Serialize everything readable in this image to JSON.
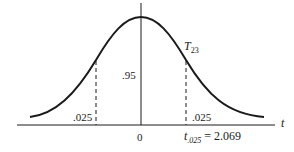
{
  "diagram": {
    "distribution_label": "T",
    "distribution_subscript": "23",
    "center_area_label": ".95",
    "left_tail_label": ".025",
    "right_tail_label": ".025",
    "axis_zero_label": "0",
    "axis_variable_label": "t",
    "critical_value_symbol": "t",
    "critical_value_subscript": ".025",
    "critical_value_text": "= 2.069",
    "colors": {
      "line": "#1a1a1a",
      "background": "#ffffff"
    }
  }
}
